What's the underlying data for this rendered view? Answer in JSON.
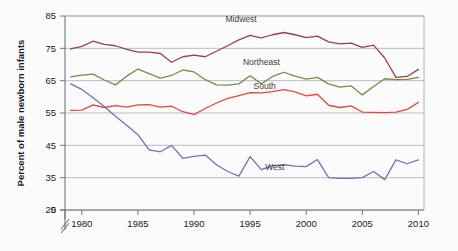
{
  "chart_data": {
    "type": "line",
    "title": "",
    "xlabel": "",
    "ylabel": "Percent of male newborn infants",
    "xlim": [
      1978.5,
      2010.5
    ],
    "ylim": [
      25,
      85
    ],
    "y_axis_break": true,
    "y_break_symbol": "//",
    "yticks": [
      0,
      25,
      35,
      45,
      55,
      65,
      75,
      85
    ],
    "ytick_labels": [
      "0",
      "25",
      "35",
      "45",
      "55",
      "65",
      "75",
      "85"
    ],
    "xticks": [
      1980,
      1985,
      1990,
      1995,
      2000,
      2005,
      2010
    ],
    "xtick_labels": [
      "1980",
      "1985",
      "1990",
      "1995",
      "2000",
      "2005",
      "2010"
    ],
    "grid": true,
    "grid_axis": "y",
    "legend_position": "inline-annotations",
    "x": [
      1979,
      1980,
      1981,
      1982,
      1983,
      1984,
      1985,
      1986,
      1987,
      1988,
      1989,
      1990,
      1991,
      1992,
      1993,
      1994,
      1995,
      1996,
      1997,
      1998,
      1999,
      2000,
      2001,
      2002,
      2003,
      2004,
      2005,
      2006,
      2007,
      2008,
      2009,
      2010
    ],
    "series": [
      {
        "name": "Midwest",
        "color": "#a03a55",
        "label_x": 1994.2,
        "label_y": 83.0,
        "values": [
          74.8,
          75.6,
          77.2,
          76.2,
          75.8,
          74.7,
          73.8,
          73.8,
          73.4,
          70.7,
          72.4,
          72.9,
          72.4,
          74.1,
          75.8,
          77.6,
          79.0,
          78.2,
          79.2,
          79.9,
          79.2,
          78.3,
          78.8,
          77.0,
          76.4,
          76.6,
          75.3,
          76.0,
          72.0,
          66.0,
          66.3,
          68.5
        ]
      },
      {
        "name": "Northeast",
        "color": "#7f8a3e",
        "label_x": 1996.0,
        "label_y": 70.0,
        "values": [
          66.2,
          66.7,
          67.0,
          65.2,
          63.7,
          66.4,
          68.6,
          67.2,
          65.8,
          66.6,
          68.3,
          67.7,
          65.3,
          63.7,
          63.6,
          64.0,
          66.5,
          64.0,
          66.3,
          67.6,
          66.4,
          65.5,
          66.0,
          64.0,
          63.0,
          63.4,
          60.6,
          63.2,
          65.6,
          65.3,
          65.4,
          66.0
        ]
      },
      {
        "name": "South",
        "color": "#e8453c",
        "label_x": 1996.3,
        "label_y": 62.5,
        "values": [
          55.8,
          55.9,
          57.5,
          56.7,
          57.3,
          56.8,
          57.5,
          57.6,
          56.8,
          57.1,
          55.4,
          54.5,
          56.4,
          58.1,
          59.5,
          60.4,
          61.3,
          61.2,
          61.6,
          62.2,
          61.5,
          60.3,
          60.8,
          57.4,
          56.7,
          57.2,
          55.3,
          55.2,
          55.1,
          55.3,
          56.1,
          58.3
        ]
      },
      {
        "name": "West",
        "color": "#6a77b5",
        "label_x": 1997.2,
        "label_y": 37.5,
        "values": [
          64.0,
          62.3,
          59.7,
          57.0,
          54.0,
          51.2,
          48.3,
          43.6,
          43.0,
          45.0,
          41.0,
          41.6,
          42.0,
          39.0,
          36.9,
          35.5,
          41.5,
          37.5,
          38.7,
          39.0,
          38.6,
          38.4,
          40.6,
          35.0,
          34.8,
          34.8,
          35.0,
          36.9,
          34.4,
          40.5,
          39.3,
          40.5
        ]
      }
    ]
  }
}
